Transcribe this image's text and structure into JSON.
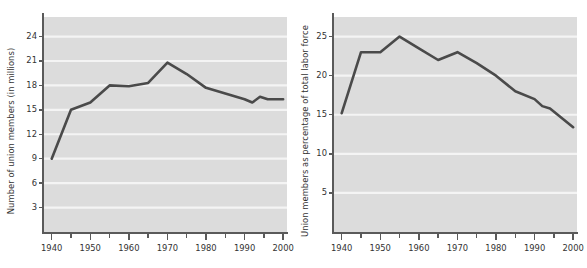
{
  "chart_data": [
    {
      "id": "union-members-count",
      "type": "line",
      "title": "",
      "xlabel": "",
      "ylabel": "Number of union members (in millions)",
      "xlim": [
        1938,
        2001
      ],
      "ylim": [
        0,
        26.4
      ],
      "yticks": [
        3,
        6,
        9,
        12,
        15,
        18,
        21,
        24
      ],
      "ytick_labels": [
        "3",
        "6",
        "9",
        "12",
        "15",
        "18",
        "21",
        "24"
      ],
      "xticks": [
        1940,
        1950,
        1960,
        1970,
        1980,
        1990,
        2000
      ],
      "xtick_labels": [
        "1940",
        "1950",
        "1960",
        "1970",
        "1980",
        "1990",
        "2000"
      ],
      "xticks_minor": [
        1945,
        1955,
        1965,
        1975,
        1985,
        1995
      ],
      "grid": "horizontal",
      "grid_color": "#f4f4f4",
      "plot_background": "#dcdcdc",
      "line_color": "#4a4a4a",
      "line_width": 2.6,
      "x": [
        1940,
        1945,
        1950,
        1955,
        1960,
        1965,
        1970,
        1975,
        1980,
        1985,
        1990,
        1992,
        1994,
        1996,
        2000
      ],
      "values": [
        9.0,
        15.0,
        15.9,
        18.0,
        17.9,
        18.3,
        20.8,
        19.4,
        17.7,
        17.0,
        16.3,
        15.9,
        16.6,
        16.3,
        16.3
      ]
    },
    {
      "id": "union-members-percent",
      "type": "line",
      "title": "",
      "xlabel": "",
      "ylabel": "Union members as percentage of total labor force",
      "xlim": [
        1938,
        2001
      ],
      "ylim": [
        0,
        27.5
      ],
      "yticks": [
        5,
        10,
        15,
        20,
        25
      ],
      "ytick_labels": [
        "5",
        "10",
        "15",
        "20",
        "25"
      ],
      "xticks": [
        1940,
        1950,
        1960,
        1970,
        1980,
        1990,
        2000
      ],
      "xtick_labels": [
        "1940",
        "1950",
        "1960",
        "1970",
        "1980",
        "1990",
        "2000"
      ],
      "xticks_minor": [
        1945,
        1955,
        1965,
        1975,
        1985,
        1995
      ],
      "grid": "horizontal",
      "grid_color": "#f4f4f4",
      "plot_background": "#dcdcdc",
      "line_color": "#4a4a4a",
      "line_width": 2.6,
      "x": [
        1940,
        1945,
        1950,
        1955,
        1960,
        1965,
        1970,
        1975,
        1980,
        1985,
        1990,
        1992,
        1994,
        1996,
        2000
      ],
      "values": [
        15.2,
        23.0,
        23.0,
        25.0,
        23.5,
        22.0,
        23.0,
        21.6,
        20.0,
        18.0,
        17.0,
        16.1,
        15.8,
        15.0,
        13.4
      ]
    }
  ]
}
